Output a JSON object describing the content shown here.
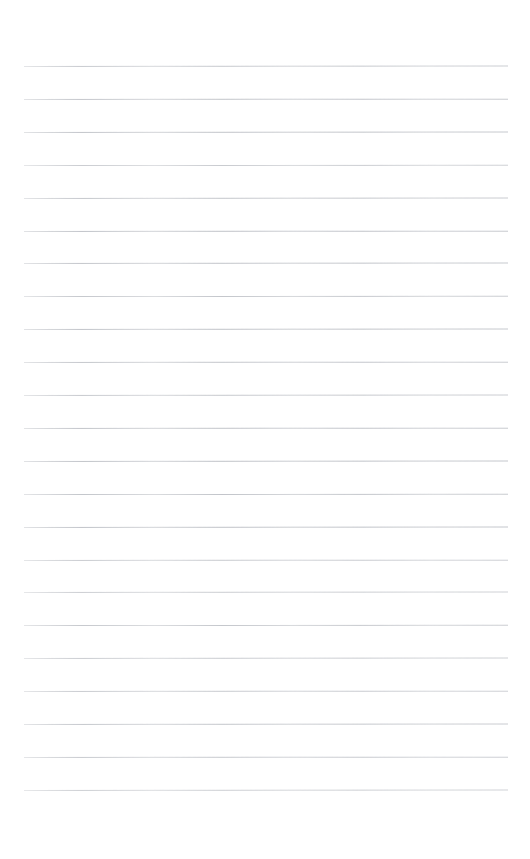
{
  "document": {
    "kind": "blank-lined-paper",
    "title": "Blank Ruled Notebook Page",
    "page_width": 530,
    "page_height": 859,
    "background_color": "#ffffff",
    "has_text": false,
    "has_images": false,
    "text_content": ""
  },
  "ruling": {
    "line_color": "#b9bcc2",
    "line_thickness": 1,
    "line_count": 23,
    "left_margin": 24,
    "right_margin": 22,
    "line_start_x": 24,
    "line_end_x": 508,
    "line_length": 484,
    "first_line_y": 66,
    "last_line_y": 790,
    "line_spacing": 32.9,
    "top_blank_height": 66,
    "bottom_blank_height": 69,
    "has_vertical_margin_rule": false,
    "has_header_rule": false,
    "lines": [
      {
        "index": 1,
        "y": 66.0,
        "opacity": 0.82,
        "slant": -0.06
      },
      {
        "index": 2,
        "y": 98.9,
        "opacity": 0.88,
        "slant": -0.04
      },
      {
        "index": 3,
        "y": 131.8,
        "opacity": 0.9,
        "slant": -0.05
      },
      {
        "index": 4,
        "y": 164.7,
        "opacity": 0.78,
        "slant": -0.03
      },
      {
        "index": 5,
        "y": 197.6,
        "opacity": 0.86,
        "slant": -0.05
      },
      {
        "index": 6,
        "y": 230.5,
        "opacity": 0.92,
        "slant": -0.04
      },
      {
        "index": 7,
        "y": 263.4,
        "opacity": 0.89,
        "slant": -0.06
      },
      {
        "index": 8,
        "y": 296.3,
        "opacity": 0.85,
        "slant": -0.03
      },
      {
        "index": 9,
        "y": 329.2,
        "opacity": 0.91,
        "slant": -0.05
      },
      {
        "index": 10,
        "y": 362.1,
        "opacity": 0.87,
        "slant": -0.04
      },
      {
        "index": 11,
        "y": 395.0,
        "opacity": 0.83,
        "slant": -0.05
      },
      {
        "index": 12,
        "y": 427.9,
        "opacity": 0.9,
        "slant": -0.04
      },
      {
        "index": 13,
        "y": 460.8,
        "opacity": 0.93,
        "slant": -0.06
      },
      {
        "index": 14,
        "y": 493.7,
        "opacity": 0.88,
        "slant": -0.03
      },
      {
        "index": 15,
        "y": 526.6,
        "opacity": 0.92,
        "slant": -0.05
      },
      {
        "index": 16,
        "y": 559.5,
        "opacity": 0.8,
        "slant": -0.04
      },
      {
        "index": 17,
        "y": 592.4,
        "opacity": 0.76,
        "slant": -0.05
      },
      {
        "index": 18,
        "y": 625.3,
        "opacity": 0.84,
        "slant": -0.03
      },
      {
        "index": 19,
        "y": 658.2,
        "opacity": 0.79,
        "slant": -0.05
      },
      {
        "index": 20,
        "y": 691.1,
        "opacity": 0.81,
        "slant": -0.04
      },
      {
        "index": 21,
        "y": 724.0,
        "opacity": 0.86,
        "slant": -0.06
      },
      {
        "index": 22,
        "y": 756.9,
        "opacity": 0.82,
        "slant": -0.04
      },
      {
        "index": 23,
        "y": 789.8,
        "opacity": 0.74,
        "slant": -0.05
      }
    ]
  }
}
